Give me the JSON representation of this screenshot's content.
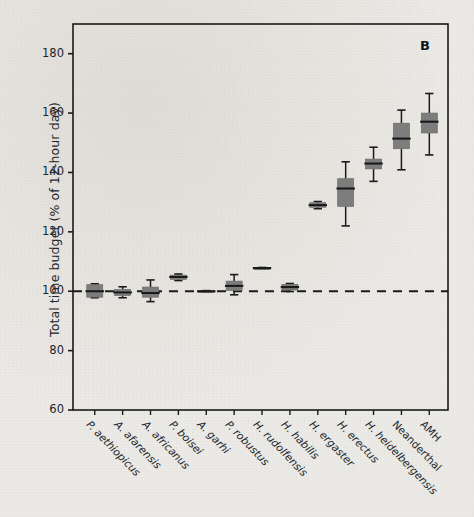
{
  "figure": {
    "panel_letter": "B",
    "ylabel": "Total time budget (% of 12-hour day)",
    "xlabel": "",
    "background_color": "#eceae6",
    "box_fill_color": "#7d7d7d",
    "line_color": "#1a1a1a",
    "reference_line_value": 100
  },
  "chart_data": {
    "type": "box",
    "title": "",
    "subtitle": "",
    "xlabel": "",
    "ylabel": "Total time budget (% of 12-hour day)",
    "ylim": [
      60,
      190
    ],
    "yticks": [
      60,
      80,
      100,
      120,
      140,
      160,
      180
    ],
    "ytick_labels": [
      "60",
      "80",
      "100",
      "120",
      "140",
      "160",
      "180"
    ],
    "grid": false,
    "legend": "none",
    "annotations": [
      {
        "text": "B",
        "position": "top-right"
      },
      {
        "text": "dashed reference line at 100",
        "value": 100
      }
    ],
    "categories": [
      "P. aethiopicus",
      "A. afarensis",
      "A. africanus",
      "P. boisei",
      "A. garhi",
      "P. robustus",
      "H. rudolfensis",
      "H. habilis",
      "H. ergaster",
      "H. erectus",
      "H. heidelbergensis",
      "Neanderthal",
      "AMH"
    ],
    "boxes": [
      {
        "category": "P. aethiopicus",
        "whisker_low": 97.8,
        "q1": 98.0,
        "median": 100.0,
        "q3": 102.2,
        "whisker_high": 102.5
      },
      {
        "category": "A. afarensis",
        "whisker_low": 97.8,
        "q1": 98.6,
        "median": 99.6,
        "q3": 100.6,
        "whisker_high": 101.5
      },
      {
        "category": "A. africanus",
        "whisker_low": 96.5,
        "q1": 98.0,
        "median": 99.4,
        "q3": 101.4,
        "whisker_high": 103.8
      },
      {
        "category": "P. boisei",
        "whisker_low": 103.6,
        "q1": 104.0,
        "median": 104.8,
        "q3": 105.4,
        "whisker_high": 105.8
      },
      {
        "category": "A. garhi",
        "whisker_low": 99.8,
        "q1": 99.9,
        "median": 100.0,
        "q3": 100.1,
        "whisker_high": 100.2
      },
      {
        "category": "P. robustus",
        "whisker_low": 98.8,
        "q1": 100.3,
        "median": 101.8,
        "q3": 103.4,
        "whisker_high": 105.6
      },
      {
        "category": "H. rudolfensis",
        "whisker_low": 107.6,
        "q1": 107.7,
        "median": 107.8,
        "q3": 107.9,
        "whisker_high": 108.0
      },
      {
        "category": "H. habilis",
        "whisker_low": 99.9,
        "q1": 100.4,
        "median": 101.4,
        "q3": 102.3,
        "whisker_high": 102.6
      },
      {
        "category": "H. ergaster",
        "whisker_low": 127.8,
        "q1": 128.3,
        "median": 129.0,
        "q3": 129.8,
        "whisker_high": 130.2
      },
      {
        "category": "H. erectus",
        "whisker_low": 122.0,
        "q1": 128.6,
        "median": 134.6,
        "q3": 137.9,
        "whisker_high": 143.6
      },
      {
        "category": "H. heidelbergensis",
        "whisker_low": 137.0,
        "q1": 141.2,
        "median": 143.0,
        "q3": 144.5,
        "whisker_high": 148.5
      },
      {
        "category": "Neanderthal",
        "whisker_low": 140.9,
        "q1": 148.0,
        "median": 151.4,
        "q3": 156.6,
        "whisker_high": 161.0
      },
      {
        "category": "AMH",
        "whisker_low": 145.9,
        "q1": 153.3,
        "median": 157.1,
        "q3": 160.0,
        "whisker_high": 166.6
      }
    ]
  }
}
